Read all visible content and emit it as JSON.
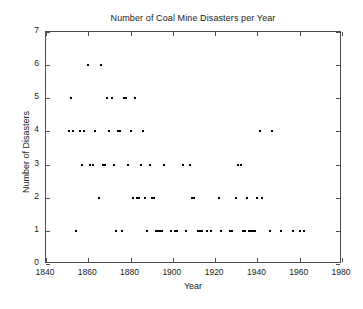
{
  "chart_data": {
    "type": "scatter",
    "title": "Number of Coal Mine Disasters per Year",
    "xlabel": "Year",
    "ylabel": "Number of Disasters",
    "xlim": [
      1840,
      1980
    ],
    "ylim": [
      0,
      7
    ],
    "xticks": [
      1840,
      1860,
      1880,
      1900,
      1920,
      1940,
      1960,
      1980
    ],
    "xticklabels": [
      "1840",
      "1860",
      "1880",
      "1900",
      "1920",
      "1940",
      "1960",
      "1980"
    ],
    "yticks": [
      0,
      1,
      2,
      3,
      4,
      5,
      6,
      7
    ],
    "yticklabels": [
      "0",
      "1",
      "2",
      "3",
      "4",
      "5",
      "6",
      "7"
    ],
    "grid": false,
    "legend": null,
    "marker": "point",
    "marker_color": "#000000",
    "marker_size_px": 2,
    "x": [
      1851,
      1852,
      1853,
      1854,
      1855,
      1856,
      1857,
      1858,
      1859,
      1860,
      1861,
      1862,
      1863,
      1864,
      1865,
      1866,
      1867,
      1868,
      1869,
      1870,
      1871,
      1872,
      1873,
      1874,
      1875,
      1876,
      1877,
      1878,
      1879,
      1880,
      1881,
      1882,
      1883,
      1884,
      1885,
      1886,
      1887,
      1888,
      1889,
      1890,
      1891,
      1892,
      1893,
      1894,
      1895,
      1896,
      1897,
      1898,
      1899,
      1900,
      1901,
      1902,
      1903,
      1904,
      1905,
      1906,
      1907,
      1908,
      1909,
      1910,
      1911,
      1912,
      1913,
      1914,
      1915,
      1916,
      1917,
      1918,
      1919,
      1920,
      1921,
      1922,
      1923,
      1924,
      1925,
      1926,
      1927,
      1928,
      1929,
      1930,
      1931,
      1932,
      1933,
      1934,
      1935,
      1936,
      1937,
      1938,
      1939,
      1940,
      1941,
      1942,
      1943,
      1944,
      1945,
      1946,
      1947,
      1948,
      1949,
      1950,
      1951,
      1952,
      1953,
      1954,
      1955,
      1956,
      1957,
      1958,
      1959,
      1960,
      1961,
      1962
    ],
    "y": [
      4,
      5,
      4,
      1,
      0,
      4,
      3,
      4,
      0,
      6,
      3,
      3,
      4,
      0,
      2,
      6,
      3,
      3,
      5,
      4,
      5,
      3,
      1,
      4,
      4,
      1,
      5,
      5,
      3,
      4,
      2,
      5,
      2,
      2,
      3,
      4,
      2,
      1,
      3,
      2,
      2,
      1,
      1,
      1,
      1,
      3,
      0,
      0,
      1,
      0,
      1,
      1,
      0,
      0,
      3,
      1,
      0,
      3,
      2,
      2,
      0,
      1,
      1,
      1,
      0,
      1,
      0,
      1,
      0,
      0,
      0,
      2,
      1,
      0,
      0,
      0,
      1,
      1,
      0,
      2,
      3,
      3,
      1,
      1,
      2,
      1,
      1,
      1,
      1,
      2,
      4,
      2,
      0,
      0,
      0,
      1,
      4,
      0,
      0,
      0,
      1,
      0,
      0,
      0,
      0,
      0,
      1,
      0,
      0,
      1,
      0,
      1
    ]
  },
  "axes": {
    "title": "Number of Coal Mine Disasters per Year",
    "x_axis_label": "Year",
    "y_axis_label": "Number of Disasters"
  }
}
